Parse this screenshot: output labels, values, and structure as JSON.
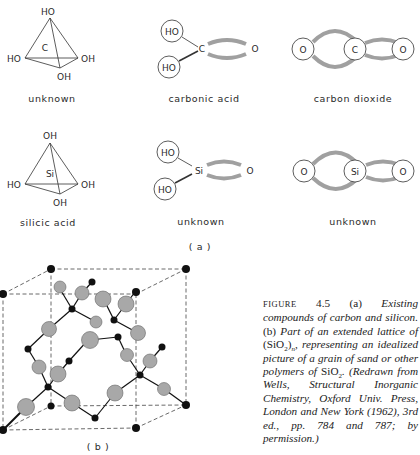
{
  "figure": {
    "panel_a_label": "(a)",
    "panel_b_label": "(b)",
    "molecules": [
      {
        "id": "c-tetra",
        "label": "unknown",
        "center": "C",
        "groups": [
          "HO",
          "HO",
          "OH",
          "OH"
        ]
      },
      {
        "id": "carbonic",
        "label": "carbonic acid",
        "center": "C",
        "groups": [
          "HO",
          "HO",
          "O"
        ]
      },
      {
        "id": "co2",
        "label": "carbon dioxide",
        "center": "C",
        "groups": [
          "O",
          "O"
        ]
      },
      {
        "id": "si-tetra",
        "label": "silicic acid",
        "center": "Si",
        "groups": [
          "OH",
          "HO",
          "OH",
          "OH"
        ]
      },
      {
        "id": "si-acid",
        "label": "unknown",
        "center": "Si",
        "groups": [
          "HO",
          "HO",
          "O"
        ]
      },
      {
        "id": "sio2",
        "label": "unknown",
        "center": "Si",
        "groups": [
          "O",
          "O"
        ]
      }
    ],
    "caption": {
      "figure_word": "FIGURE",
      "figure_number": "4.5",
      "part_a": "(a)",
      "text_a": "Existing compounds of carbon and silicon.",
      "part_b": "(b)",
      "text_b1": "Part of an extended lattice of",
      "formula1": "(SiO",
      "formula1_sub": "2",
      "formula1_end": ")",
      "formula1_n": "n",
      "text_b2": ", representing an idealized picture of a grain of sand or other polymers of",
      "formula2": "SiO",
      "formula2_sub": "2",
      "text_b3": ". (Redrawn from Wells, Structural Inorganic Chemistry, Oxford Univ. Press, London and New York (1962), 3rd ed., pp. 784 and 787; by permission.)"
    },
    "colors": {
      "ink": "#1a1a1a",
      "bond_gray": "#a0a0a0",
      "oxygen_fill": "#a8a8a8",
      "silicon_fill": "#111111"
    }
  }
}
